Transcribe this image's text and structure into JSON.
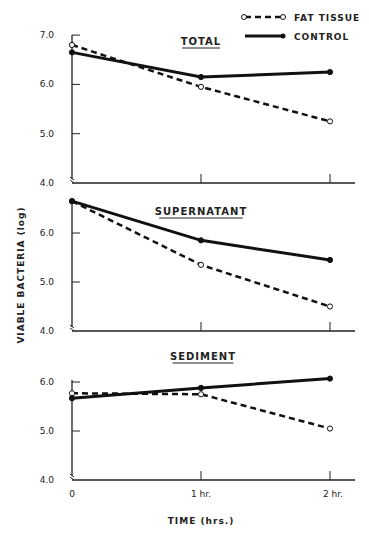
{
  "chart_data": {
    "type": "line",
    "title": "",
    "xlabel": "TIME (hrs.)",
    "ylabel": "VIABLE BACTERIA (log)",
    "categories": [
      "0",
      "1 hr.",
      "2 hr."
    ],
    "x": [
      0,
      1,
      2
    ],
    "legend": {
      "position": "top-right",
      "entries": [
        {
          "name": "FAT TISSUE",
          "style": "dashed",
          "marker": "open-circle"
        },
        {
          "name": "CONTROL",
          "style": "solid",
          "marker": "filled-circle"
        }
      ]
    },
    "grid": false,
    "panels": [
      {
        "title": "TOTAL",
        "ylim": [
          4.0,
          7.0
        ],
        "yticks": [
          "7.0",
          "6.0",
          "5.0",
          "4.0"
        ],
        "series": [
          {
            "name": "FAT TISSUE",
            "values": [
              6.8,
              5.95,
              5.25
            ]
          },
          {
            "name": "CONTROL",
            "values": [
              6.65,
              6.15,
              6.25
            ]
          }
        ]
      },
      {
        "title": "SUPERNATANT",
        "ylim": [
          4.0,
          6.65
        ],
        "yticks": [
          "6.0",
          "5.0",
          "4.0"
        ],
        "series": [
          {
            "name": "FAT TISSUE",
            "values": [
              6.65,
              5.35,
              4.5
            ]
          },
          {
            "name": "CONTROL",
            "values": [
              6.65,
              5.85,
              5.45
            ]
          }
        ]
      },
      {
        "title": "SEDIMENT",
        "ylim": [
          4.0,
          6.0
        ],
        "yticks": [
          "6.0",
          "5.0",
          "4.0"
        ],
        "series": [
          {
            "name": "FAT TISSUE",
            "values": [
              5.77,
              5.75,
              5.05
            ]
          },
          {
            "name": "CONTROL",
            "values": [
              5.67,
              5.88,
              6.07
            ]
          }
        ]
      }
    ]
  },
  "labels": {
    "legend_fat": "FAT TISSUE",
    "legend_control": "CONTROL",
    "ylabel": "VIABLE BACTERIA  (log)",
    "xlabel": "TIME (hrs.)",
    "x0": "0",
    "x1": "1 hr.",
    "x2": "2 hr."
  }
}
